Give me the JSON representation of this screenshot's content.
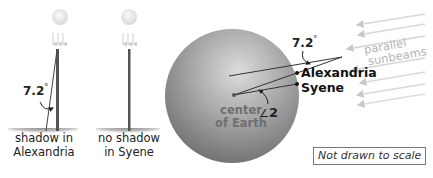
{
  "diagram": {
    "left_panel": {
      "stick_alexandria": {
        "ground_label_line1": "shadow in",
        "ground_label_line2": "Alexandria",
        "angle_label": "7.2",
        "degree_symbol": "°"
      },
      "stick_syene": {
        "ground_label_line1": "no shadow",
        "ground_label_line2": "in Syene"
      }
    },
    "earth_panel": {
      "angle_top_label": "7.2",
      "degree_symbol": "°",
      "alexandria_label": "Alexandria",
      "syene_label": "Syene",
      "center_label_line1": "center",
      "center_label_line2": "of Earth",
      "center_angle_symbol": "∠",
      "center_angle_label": "2",
      "sunbeams_label_line1": "parallel",
      "sunbeams_label_line2": "sunbeams"
    },
    "note": "Not drawn to scale",
    "colors": {
      "earth_light": "#d6d6d6",
      "earth_dark": "#6e6e6e",
      "stick": "#555555",
      "sunbeam": "#cfcfcf",
      "shadow": "#9a9a9a",
      "sun": "#e4e4e4"
    }
  }
}
